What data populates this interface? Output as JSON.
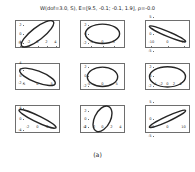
{
  "figure": {
    "title": "W(dof=3.0, S), E=[9.5, -0.1; -0.1, 1.9], ρ=-0.0",
    "caption": "(a)"
  },
  "chart_data": {
    "type": "scatter",
    "title": "W(dof=3.0, S), E=[9.5, -0.1; -0.1, 1.9], ρ=-0.0",
    "caption": "(a)",
    "grid_rows": 3,
    "grid_cols": 3,
    "xlabel": "",
    "ylabel": "",
    "grid": false,
    "legend": null,
    "panels": [
      {
        "index": 0,
        "row": 0,
        "col": 0,
        "xlim": [
          -5,
          5
        ],
        "ylim": [
          -3,
          3
        ],
        "xticks": [
          "-4",
          "-2",
          "0",
          "2",
          "4"
        ],
        "xtick_values": [
          -4,
          -2,
          0,
          2,
          4
        ],
        "yticks": [
          "-2",
          "0",
          "2"
        ],
        "ytick_values": [
          -2,
          0,
          2
        ],
        "ellipse": {
          "cx": 0,
          "cy": 0,
          "rx": 4.4,
          "ry": 1.35,
          "angle_deg": -37
        },
        "correlation": 0.82
      },
      {
        "index": 1,
        "row": 0,
        "col": 1,
        "xlim": [
          -10,
          10
        ],
        "ylim": [
          -3,
          3
        ],
        "xticks": [
          "-5",
          "0",
          "5"
        ],
        "xtick_values": [
          -5,
          0,
          5
        ],
        "yticks": [
          "-2",
          "0",
          "2"
        ],
        "ytick_values": [
          -2,
          0,
          2
        ],
        "ellipse": {
          "cx": 0,
          "cy": 0,
          "rx": 7.6,
          "ry": 2.1,
          "angle_deg": 0
        },
        "correlation": 0.0
      },
      {
        "index": 2,
        "row": 0,
        "col": 2,
        "xlim": [
          -14,
          14
        ],
        "ylim": [
          -4,
          4
        ],
        "xticks": [
          "-10",
          "0",
          "10"
        ],
        "xtick_values": [
          -10,
          0,
          10
        ],
        "yticks": [
          "-5",
          "0",
          "5"
        ],
        "ytick_values": [
          -5,
          0,
          5
        ],
        "ellipse": {
          "cx": 0,
          "cy": 0,
          "rx": 11.5,
          "ry": 0.75,
          "angle_deg": 11
        },
        "correlation": -0.97
      },
      {
        "index": 3,
        "row": 1,
        "col": 0,
        "xlim": [
          -8,
          8
        ],
        "ylim": [
          -4,
          4
        ],
        "xticks": [
          "-5",
          "0",
          "5"
        ],
        "xtick_values": [
          -5,
          0,
          5
        ],
        "yticks": [
          "-2",
          "0",
          "2",
          "4"
        ],
        "ytick_values": [
          -2,
          0,
          2,
          4
        ],
        "ellipse": {
          "cx": 0,
          "cy": 0,
          "rx": 6.6,
          "ry": 1.7,
          "angle_deg": 17
        },
        "correlation": -0.78
      },
      {
        "index": 4,
        "row": 1,
        "col": 1,
        "xlim": [
          -8,
          8
        ],
        "ylim": [
          -3,
          3
        ],
        "xticks": [
          "-5",
          "0",
          "5"
        ],
        "xtick_values": [
          -5,
          0,
          5
        ],
        "yticks": [
          "-2",
          "0",
          "2"
        ],
        "ytick_values": [
          -2,
          0,
          2
        ],
        "ellipse": {
          "cx": 0,
          "cy": 0,
          "rx": 5.4,
          "ry": 2.1,
          "angle_deg": 0
        },
        "correlation": 0.0
      },
      {
        "index": 5,
        "row": 1,
        "col": 2,
        "xlim": [
          -7,
          7
        ],
        "ylim": [
          -3,
          3
        ],
        "xticks": [
          "-4",
          "-2",
          "0",
          "2",
          "4"
        ],
        "xtick_values": [
          -4,
          -2,
          0,
          2,
          4
        ],
        "yticks": [
          "-2",
          "0",
          "2"
        ],
        "ytick_values": [
          -2,
          0,
          2
        ],
        "ellipse": {
          "cx": 0,
          "cy": 0,
          "rx": 5.6,
          "ry": 2.2,
          "angle_deg": 0
        },
        "correlation": 0.0
      },
      {
        "index": 6,
        "row": 2,
        "col": 0,
        "xlim": [
          -4.5,
          4.5
        ],
        "ylim": [
          -5,
          5
        ],
        "xticks": [
          "-2",
          "0",
          "2"
        ],
        "xtick_values": [
          -2,
          0,
          2
        ],
        "yticks": [
          "-4",
          "0",
          "4"
        ],
        "ytick_values": [
          -4,
          0,
          4
        ],
        "ellipse": {
          "cx": 0,
          "cy": 0,
          "rx": 4.9,
          "ry": 1.0,
          "angle_deg": 42
        },
        "correlation": -0.9
      },
      {
        "index": 7,
        "row": 2,
        "col": 1,
        "xlim": [
          -5,
          5
        ],
        "ylim": [
          -3.5,
          3.5
        ],
        "xticks": [
          "-4",
          "-2",
          "0",
          "2",
          "4"
        ],
        "xtick_values": [
          -4,
          -2,
          0,
          2,
          4
        ],
        "yticks": [
          "-2",
          "0",
          "2"
        ],
        "ytick_values": [
          -2,
          0,
          2
        ],
        "ellipse": {
          "cx": 0,
          "cy": 0,
          "rx": 3.4,
          "ry": 1.8,
          "angle_deg": -68
        },
        "correlation": 0.55
      },
      {
        "index": 8,
        "row": 2,
        "col": 2,
        "xlim": [
          -14,
          14
        ],
        "ylim": [
          -4,
          4
        ],
        "xticks": [
          "-10",
          "0",
          "10"
        ],
        "xtick_values": [
          -10,
          0,
          10
        ],
        "yticks": [
          "-5",
          "0",
          "5"
        ],
        "ytick_values": [
          -5,
          0,
          5
        ],
        "ellipse": {
          "cx": 0,
          "cy": 0,
          "rx": 11.5,
          "ry": 0.8,
          "angle_deg": -12
        },
        "correlation": 0.97
      }
    ]
  }
}
